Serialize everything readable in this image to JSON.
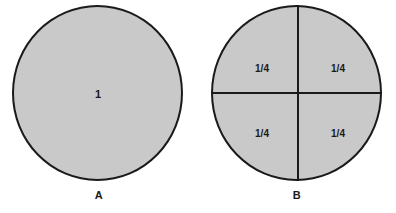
{
  "diagram": {
    "type": "fraction-circles",
    "background_color": "#ffffff",
    "fill_color": "#c9c9c9",
    "stroke_color": "#1a1a1a",
    "figures": [
      {
        "caption": "A",
        "shape": "circle",
        "partitions": 1,
        "labels": [
          "1"
        ],
        "center_value": "1"
      },
      {
        "caption": "B",
        "shape": "circle",
        "partitions": 4,
        "labels": [
          "1/4",
          "1/4",
          "1/4",
          "1/4"
        ],
        "quadrants": {
          "top_left": "1/4",
          "top_right": "1/4",
          "bottom_left": "1/4",
          "bottom_right": "1/4"
        }
      }
    ]
  }
}
